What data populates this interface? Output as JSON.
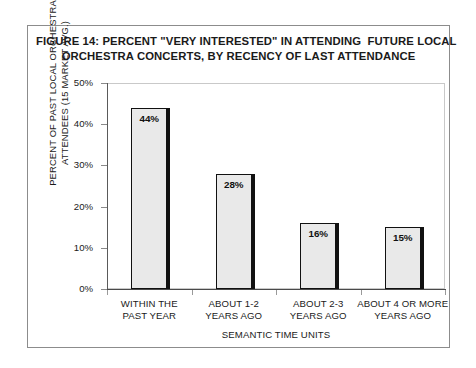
{
  "figure": {
    "title_line1": "FIGURE 14: PERCENT \"VERY INTERESTED\" IN ATTENDING  FUTURE LOCAL",
    "title_line2": "ORCHESTRA CONCERTS, BY RECENCY OF LAST ATTENDANCE",
    "border_color": "#8c8c8c"
  },
  "axes": {
    "y_title_line1": "PERCENT OF PAST LOCAL ORCHESTRA",
    "y_title_line2": "ATTENDEES (15 MARKET AVG.)",
    "x_title": "SEMANTIC TIME UNITS",
    "y_ticks": [
      "50%",
      "40%",
      "30%",
      "20%",
      "10%",
      "0%"
    ]
  },
  "chart_data": {
    "type": "bar",
    "title": "FIGURE 14: PERCENT \"VERY INTERESTED\" IN ATTENDING  FUTURE LOCAL ORCHESTRA CONCERTS, BY RECENCY OF LAST ATTENDANCE",
    "xlabel": "SEMANTIC TIME UNITS",
    "ylabel": "PERCENT OF PAST LOCAL ORCHESTRA ATTENDEES (15 MARKET AVG.)",
    "categories": [
      "WITHIN THE PAST YEAR",
      "ABOUT 1-2 YEARS AGO",
      "ABOUT 2-3 YEARS AGO",
      "ABOUT 4 OR MORE YEARS AGO"
    ],
    "category_lines": [
      [
        "WITHIN THE",
        "PAST YEAR"
      ],
      [
        "ABOUT 1-2",
        "YEARS AGO"
      ],
      [
        "ABOUT 2-3",
        "YEARS AGO"
      ],
      [
        "ABOUT 4 OR MORE",
        "YEARS AGO"
      ]
    ],
    "values": [
      44,
      28,
      16,
      15
    ],
    "data_labels": [
      "44%",
      "28%",
      "16%",
      "15%"
    ],
    "ylim": [
      0,
      50
    ],
    "ytick_values": [
      50,
      40,
      30,
      20,
      10,
      0
    ],
    "ytick_labels": [
      "50%",
      "40%",
      "30%",
      "20%",
      "10%",
      "0%"
    ],
    "grid": false,
    "legend": false,
    "bar_fill_color": "#e9e9e9",
    "bar_edge_color": "#111111"
  }
}
